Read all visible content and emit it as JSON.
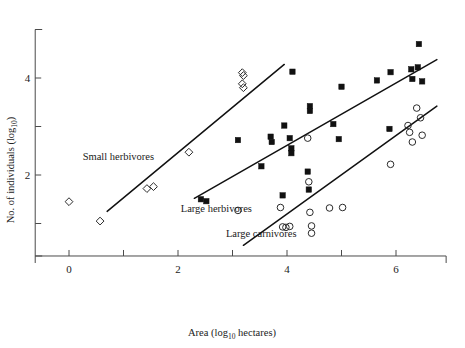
{
  "chart_data": {
    "type": "scatter",
    "title": "",
    "xlabel": "Area (log10 hectares)",
    "xlabel_main": "Area (log",
    "xlabel_sub": "10",
    "xlabel_tail": " hectares)",
    "ylabel": "No. of individuals (log10)",
    "ylabel_main": "No. of individuals (log",
    "ylabel_sub": "10",
    "ylabel_tail": ")",
    "xlim": [
      -0.6,
      7.0
    ],
    "ylim": [
      0.25,
      5.1
    ],
    "grid": false,
    "legend_position": "inline-annotations",
    "xticks": [
      0,
      1,
      2,
      3,
      4,
      5,
      6
    ],
    "xticklabels": [
      "0",
      "",
      "2",
      "",
      "4",
      "",
      "6"
    ],
    "yticks": [
      1,
      2,
      3,
      4,
      5
    ],
    "yticklabels": [
      "",
      "2",
      "",
      "4",
      ""
    ],
    "series": [
      {
        "name": "Small herbivores",
        "marker": "open-diamond",
        "annotation": "Small herbivores",
        "annotation_xy": [
          0.25,
          2.3
        ],
        "points": [
          [
            0.0,
            1.45
          ],
          [
            0.57,
            1.05
          ],
          [
            1.43,
            1.72
          ],
          [
            1.55,
            1.76
          ],
          [
            2.2,
            2.47
          ],
          [
            3.18,
            4.11
          ],
          [
            3.2,
            4.05
          ],
          [
            3.18,
            3.88
          ],
          [
            3.2,
            3.8
          ]
        ],
        "fit_line": {
          "x0": 0.7,
          "y0": 1.25,
          "x1": 3.95,
          "y1": 4.28
        }
      },
      {
        "name": "Large herbivores",
        "marker": "filled-square",
        "annotation": "Large herbivores",
        "annotation_xy": [
          2.05,
          1.23
        ],
        "points": [
          [
            2.42,
            1.5
          ],
          [
            2.52,
            1.46
          ],
          [
            3.1,
            2.72
          ],
          [
            3.53,
            2.18
          ],
          [
            3.7,
            2.79
          ],
          [
            3.72,
            2.68
          ],
          [
            3.92,
            1.58
          ],
          [
            3.95,
            3.02
          ],
          [
            4.05,
            2.76
          ],
          [
            4.08,
            2.55
          ],
          [
            4.08,
            2.45
          ],
          [
            4.1,
            4.13
          ],
          [
            4.38,
            2.07
          ],
          [
            4.4,
            1.7
          ],
          [
            4.42,
            3.42
          ],
          [
            4.42,
            3.32
          ],
          [
            4.85,
            3.05
          ],
          [
            4.95,
            2.74
          ],
          [
            5.0,
            3.82
          ],
          [
            5.65,
            3.95
          ],
          [
            5.88,
            2.95
          ],
          [
            5.9,
            4.12
          ],
          [
            6.28,
            4.18
          ],
          [
            6.3,
            3.98
          ],
          [
            6.4,
            4.22
          ],
          [
            6.42,
            4.7
          ],
          [
            6.48,
            3.93
          ]
        ],
        "fit_line": {
          "x0": 2.3,
          "y0": 1.52,
          "x1": 6.75,
          "y1": 4.38
        }
      },
      {
        "name": "Large carnivores",
        "marker": "open-circle",
        "annotation": "Large carnivores",
        "annotation_xy": [
          2.88,
          0.72
        ],
        "points": [
          [
            3.1,
            1.27
          ],
          [
            3.88,
            1.33
          ],
          [
            3.92,
            0.93
          ],
          [
            3.98,
            0.92
          ],
          [
            4.05,
            0.94
          ],
          [
            4.38,
            2.76
          ],
          [
            4.4,
            1.86
          ],
          [
            4.42,
            1.23
          ],
          [
            4.45,
            0.95
          ],
          [
            4.45,
            0.8
          ],
          [
            4.78,
            1.32
          ],
          [
            5.02,
            1.33
          ],
          [
            5.9,
            2.22
          ],
          [
            6.22,
            3.02
          ],
          [
            6.25,
            2.88
          ],
          [
            6.3,
            2.68
          ],
          [
            6.38,
            3.38
          ],
          [
            6.45,
            3.18
          ],
          [
            6.48,
            2.82
          ]
        ],
        "fit_line": {
          "x0": 3.2,
          "y0": 0.55,
          "x1": 6.75,
          "y1": 3.42
        }
      }
    ]
  }
}
